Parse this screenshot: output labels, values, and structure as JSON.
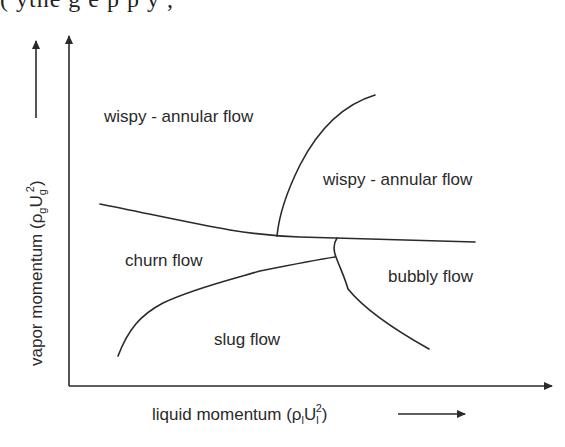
{
  "page": {
    "cut_off_text": "(                     ythe g  e        p       p  y  ,"
  },
  "diagram": {
    "x_axis": {
      "label_prefix": "liquid momentum (ρ",
      "label_sub1": "l",
      "label_mid": "U",
      "label_sub2": "l",
      "label_sup": "2",
      "label_suffix": ")"
    },
    "y_axis": {
      "label_prefix": "vapor momentum (ρ",
      "label_sub1": "g",
      "label_mid": "U",
      "label_sub2": "g",
      "label_sup": "2",
      "label_suffix": ")"
    },
    "regions": [
      {
        "label": "wispy - annular flow",
        "x": 104,
        "y": 122
      },
      {
        "label": "wispy - annular flow",
        "x": 323,
        "y": 185
      },
      {
        "label": "churn flow",
        "x": 125,
        "y": 266
      },
      {
        "label": "bubbly flow",
        "x": 388,
        "y": 282
      },
      {
        "label": "slug flow",
        "x": 214,
        "y": 345
      }
    ],
    "colors": {
      "line": "#2a2a2a",
      "text": "#2a2a2a",
      "background": "#ffffff"
    }
  }
}
